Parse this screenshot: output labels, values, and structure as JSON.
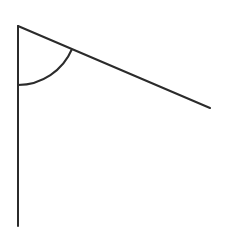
{
  "diagram": {
    "type": "angle",
    "colors": {
      "stroke": "#2b2b2b",
      "background": "#ffffff"
    },
    "vertex": {
      "x": 18,
      "y": 26
    },
    "rays": [
      {
        "name": "vertical-ray",
        "x1": 18,
        "y1": 26,
        "x2": 18,
        "y2": 226
      },
      {
        "name": "slanted-ray",
        "x1": 18,
        "y1": 26,
        "x2": 210,
        "y2": 108
      }
    ],
    "arc": {
      "radius": 59,
      "start": {
        "x": 18,
        "y": 85
      },
      "end": {
        "x": 72,
        "y": 49
      }
    }
  }
}
